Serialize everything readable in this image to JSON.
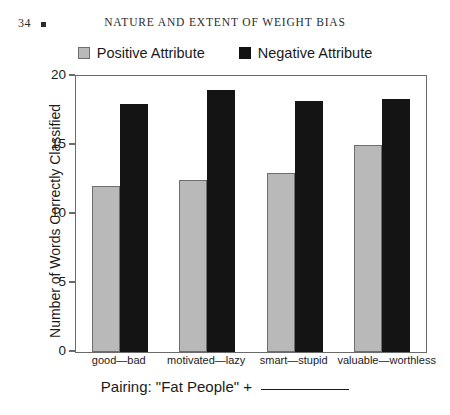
{
  "page": {
    "folio": "34",
    "running_head": "NATURE AND EXTENT OF WEIGHT BIAS"
  },
  "chart_data": {
    "type": "bar",
    "title": "",
    "categories": [
      "good—bad",
      "motivated—lazy",
      "smart—stupid",
      "valuable—worthless"
    ],
    "series": [
      {
        "name": "Positive Attribute",
        "color": "#b9b9b9",
        "values": [
          12,
          12.5,
          13,
          15
        ]
      },
      {
        "name": "Negative Attribute",
        "color": "#141414",
        "values": [
          18,
          19,
          18.2,
          18.3
        ]
      }
    ],
    "xlabel": "Pairing: \"Fat People\" + ",
    "xlabel_blank": "__________",
    "ylabel": "Number of Words Correctly Classified",
    "ylim": [
      0,
      20
    ],
    "yticks": [
      0,
      5,
      10,
      15,
      20
    ],
    "ytick_labels": [
      "0",
      "5",
      "10",
      "15",
      "20"
    ],
    "grid": false,
    "legend_position": "top-center"
  }
}
